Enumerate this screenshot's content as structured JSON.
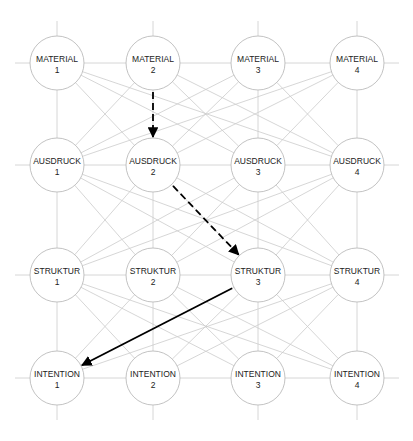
{
  "diagram": {
    "title": "",
    "columns_x": [
      57,
      153,
      258,
      357
    ],
    "rows_y": [
      63,
      165,
      275,
      378
    ],
    "node_radius": 27,
    "rows": [
      {
        "name": "MATERIAL",
        "nodes": [
          {
            "label": "MATERIAL",
            "num": "1"
          },
          {
            "label": "MATERIAL",
            "num": "2"
          },
          {
            "label": "MATERIAL",
            "num": "3"
          },
          {
            "label": "MATERIAL",
            "num": "4"
          }
        ]
      },
      {
        "name": "AUSDRUCK",
        "nodes": [
          {
            "label": "AUSDRUCK",
            "num": "1"
          },
          {
            "label": "AUSDRUCK",
            "num": "2"
          },
          {
            "label": "AUSDRUCK",
            "num": "3"
          },
          {
            "label": "AUSDRUCK",
            "num": "4"
          }
        ]
      },
      {
        "name": "STRUKTUR",
        "nodes": [
          {
            "label": "STRUKTUR",
            "num": "1"
          },
          {
            "label": "STRUKTUR",
            "num": "2"
          },
          {
            "label": "STRUKTUR",
            "num": "3"
          },
          {
            "label": "STRUKTUR",
            "num": "4"
          }
        ]
      },
      {
        "name": "INTENTION",
        "nodes": [
          {
            "label": "INTENTION",
            "num": "1"
          },
          {
            "label": "INTENTION",
            "num": "2"
          },
          {
            "label": "INTENTION",
            "num": "3"
          },
          {
            "label": "INTENTION",
            "num": "4"
          }
        ]
      }
    ],
    "highlighted_path": [
      {
        "from": "MATERIAL 2",
        "to": "AUSDRUCK 2",
        "style": "dashed"
      },
      {
        "from": "AUSDRUCK 2",
        "to": "STRUKTUR 3",
        "style": "dashed"
      },
      {
        "from": "STRUKTUR 3",
        "to": "INTENTION 1",
        "style": "solid"
      }
    ],
    "colors": {
      "node_stroke": "#bbbbbb",
      "grid_line": "#cccccc",
      "path_line": "#000000",
      "text": "#222222"
    }
  }
}
